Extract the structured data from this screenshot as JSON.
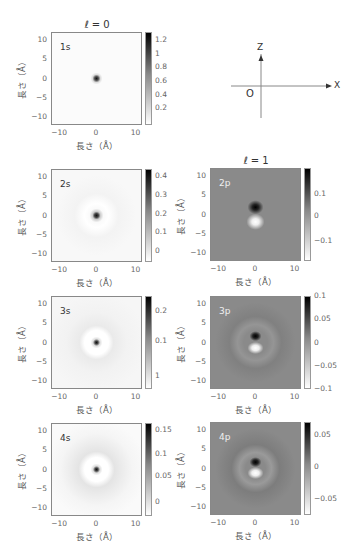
{
  "headers": {
    "l0": "ℓ = 0",
    "l1": "ℓ = 1"
  },
  "axis": {
    "xlabel": "長さ（Å）",
    "ylabel": "長さ（Å）",
    "xticks": [
      "−10",
      "0",
      "10"
    ],
    "yticks": [
      "10",
      "5",
      "0",
      "−5",
      "−10"
    ]
  },
  "diagram": {
    "z": "Z",
    "x": "X",
    "origin": "O"
  },
  "chart_data": [
    {
      "type": "heatmap",
      "title": "1s",
      "group": "ℓ = 0",
      "xlabel": "長さ（Å）",
      "ylabel": "長さ（Å）",
      "xlim": [
        -12.5,
        12.5
      ],
      "ylim": [
        -12.5,
        12.5
      ],
      "colorbar": {
        "ticks": [
          "1.2",
          "1",
          "0.8",
          "0.6",
          "0.4",
          "0.2"
        ],
        "range": [
          0,
          1.3
        ]
      }
    },
    {
      "type": "heatmap",
      "title": "2s",
      "group": "ℓ = 0",
      "xlabel": "長さ（Å）",
      "ylabel": "長さ（Å）",
      "xlim": [
        -12.5,
        12.5
      ],
      "ylim": [
        -12.5,
        12.5
      ],
      "colorbar": {
        "ticks": [
          "0.4",
          "0.3",
          "0.2",
          "0.1",
          "0"
        ],
        "range": [
          -0.02,
          0.45
        ]
      }
    },
    {
      "type": "heatmap",
      "title": "2p",
      "group": "ℓ = 1",
      "xlabel": "長さ（Å）",
      "ylabel": "長さ（Å）",
      "xlim": [
        -12.5,
        12.5
      ],
      "ylim": [
        -12.5,
        12.5
      ],
      "colorbar": {
        "ticks": [
          "0.1",
          "0",
          "−0.1"
        ],
        "range": [
          -0.18,
          0.18
        ]
      }
    },
    {
      "type": "heatmap",
      "title": "3s",
      "group": "ℓ = 0",
      "xlabel": "長さ（Å）",
      "ylabel": "長さ（Å）",
      "xlim": [
        -12.5,
        12.5
      ],
      "ylim": [
        -12.5,
        12.5
      ],
      "colorbar": {
        "ticks": [
          "0.2",
          "0.1",
          "1"
        ],
        "range": [
          -0.02,
          0.24
        ]
      }
    },
    {
      "type": "heatmap",
      "title": "3p",
      "group": "ℓ = 1",
      "xlabel": "長さ（Å）",
      "ylabel": "長さ（Å）",
      "xlim": [
        -12.5,
        12.5
      ],
      "ylim": [
        -12.5,
        12.5
      ],
      "colorbar": {
        "ticks": [
          "0.1",
          "0.05",
          "0",
          "−0.05",
          "−0.1"
        ],
        "range": [
          -0.1,
          0.1
        ]
      }
    },
    {
      "type": "heatmap",
      "title": "4s",
      "group": "ℓ = 0",
      "xlabel": "長さ（Å）",
      "ylabel": "長さ（Å）",
      "xlim": [
        -12.5,
        12.5
      ],
      "ylim": [
        -12.5,
        12.5
      ],
      "colorbar": {
        "ticks": [
          "0.15",
          "0.1",
          "0.05",
          "0"
        ],
        "range": [
          -0.02,
          0.16
        ]
      }
    },
    {
      "type": "heatmap",
      "title": "4p",
      "group": "ℓ = 1",
      "xlabel": "長さ（Å）",
      "ylabel": "長さ（Å）",
      "xlim": [
        -12.5,
        12.5
      ],
      "ylim": [
        -12.5,
        12.5
      ],
      "colorbar": {
        "ticks": [
          "0.05",
          "0",
          "−0.05"
        ],
        "range": [
          -0.07,
          0.07
        ]
      }
    }
  ]
}
